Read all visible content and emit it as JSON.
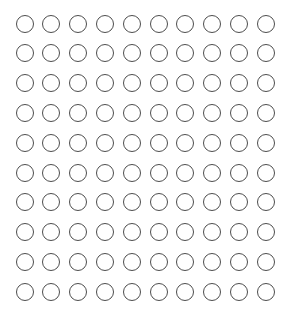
{
  "grid": {
    "rows": 10,
    "columns": 10,
    "total_circles": 100,
    "circle_style": "outline",
    "stroke_color": "#4d4d4d",
    "fill_color": "none",
    "background_color": "#ffffff",
    "origin_center": [
      25,
      24
    ],
    "spacing_x": 26.8,
    "spacing_y": 29.8,
    "diameter": 19
  }
}
